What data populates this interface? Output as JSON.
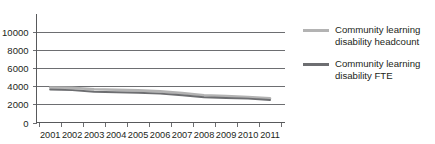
{
  "chart_data": {
    "type": "line",
    "title": "",
    "xlabel": "",
    "ylabel": "",
    "x": [
      2001,
      2002,
      2003,
      2004,
      2005,
      2006,
      2007,
      2008,
      2009,
      2010,
      2011
    ],
    "categories": [
      "2001",
      "2002",
      "2003",
      "2004",
      "2005",
      "2006",
      "2007",
      "2008",
      "2009",
      "2010",
      "2011"
    ],
    "ylim": [
      0,
      10000
    ],
    "yticks": [
      0,
      2000,
      4000,
      6000,
      8000,
      10000
    ],
    "ytick_labels": [
      "0",
      "2000",
      "4000",
      "6000",
      "8000",
      "10000"
    ],
    "grid": true,
    "legend_position": "right",
    "series": [
      {
        "name": "Community learning disability headcount",
        "color": "#b3b3b3",
        "values": [
          3850,
          3800,
          3650,
          3600,
          3530,
          3420,
          3230,
          3000,
          2900,
          2800,
          2650
        ]
      },
      {
        "name": "Community learning disability FTE",
        "color": "#6d6e71",
        "values": [
          3620,
          3560,
          3380,
          3330,
          3270,
          3170,
          3000,
          2780,
          2700,
          2620,
          2480
        ]
      }
    ]
  },
  "legend": {
    "items": [
      {
        "label": "Community learning disability headcount",
        "color": "#b3b3b3"
      },
      {
        "label": "Community learning disability FTE",
        "color": "#6d6e71"
      }
    ]
  },
  "axes": {
    "y_tick_labels": [
      "10000",
      "8000",
      "6000",
      "4000",
      "2000",
      "0"
    ],
    "x_tick_labels": [
      "2001",
      "2002",
      "2003",
      "2004",
      "2005",
      "2006",
      "2007",
      "2008",
      "2009",
      "2010",
      "2011"
    ]
  },
  "colors": {
    "grid": "#6d6e71",
    "axis": "#58595b",
    "text": "#231f20",
    "series_light": "#b3b3b3",
    "series_dark": "#6d6e71",
    "background": "#ffffff"
  }
}
